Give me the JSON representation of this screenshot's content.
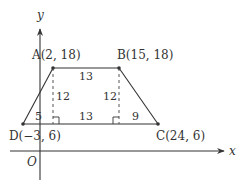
{
  "diagram": {
    "type": "coordinate-geometry-trapezoid",
    "axes": {
      "x_label": "x",
      "y_label": "y",
      "origin_label": "O"
    },
    "points": {
      "A": {
        "label": "A(2, 18)",
        "x": 2,
        "y": 18
      },
      "B": {
        "label": "B(15, 18)",
        "x": 15,
        "y": 18
      },
      "C": {
        "label": "C(24, 6)",
        "x": 24,
        "y": 6
      },
      "D": {
        "label": "D(−3, 6)",
        "x": -3,
        "y": 6
      }
    },
    "measurements": {
      "top_AB": "13",
      "height_left": "12",
      "height_right": "12",
      "base_left_segment": "5",
      "base_middle_segment": "13",
      "base_right_segment": "9"
    },
    "colors": {
      "line": "#333333",
      "background": "#ffffff"
    }
  }
}
